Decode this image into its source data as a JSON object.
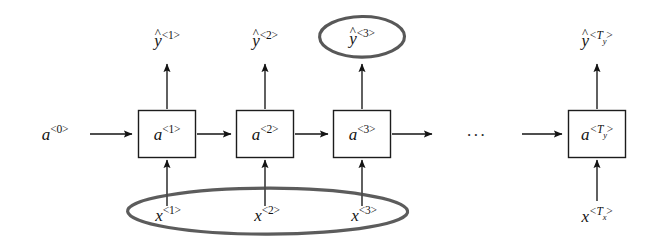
{
  "figure": {
    "background_color": "#ffffff",
    "ink_color": "#141414",
    "annotation_color": "#4a4a4a"
  },
  "inputs": {
    "initial_activation": {
      "base": "a",
      "superscript": "<0>",
      "text": "a<0>"
    },
    "sequence": [
      {
        "base": "x",
        "superscript": "<1>",
        "text": "x<1>"
      },
      {
        "base": "x",
        "superscript": "<2>",
        "text": "x<2>"
      },
      {
        "base": "x",
        "superscript": "<3>",
        "text": "x<3>"
      },
      {
        "base": "x",
        "superscript": "<T",
        "subscript": "x",
        "text": "x<Tx>"
      }
    ]
  },
  "cells": [
    {
      "base": "a",
      "superscript": "<1>",
      "text": "a<1>"
    },
    {
      "base": "a",
      "superscript": "<2>",
      "text": "a<2>"
    },
    {
      "base": "a",
      "superscript": "<3>",
      "text": "a<3>"
    },
    {
      "base": "a",
      "superscript": "<T",
      "subscript": "y",
      "text": "a<Ty>"
    }
  ],
  "outputs": [
    {
      "base": "y",
      "hat": "^",
      "superscript": "<1>",
      "text": "y^<1>"
    },
    {
      "base": "y",
      "hat": "^",
      "superscript": "<2>",
      "text": "y^<2>"
    },
    {
      "base": "y",
      "hat": "^",
      "superscript": "<3>",
      "text": "y^<3>"
    },
    {
      "base": "y",
      "hat": "^",
      "superscript": "<T",
      "subscript": "y",
      "text": "y^<Ty>"
    }
  ],
  "ellipsis": {
    "label": "..."
  },
  "annotations": [
    {
      "name": "output-highlight",
      "shape": "ellipse",
      "target": "y^<3>",
      "color": "#4a4a4a"
    },
    {
      "name": "input-sequence-highlight",
      "shape": "ellipse",
      "target": "x<1> x<2> x<3>",
      "color": "#4a4a4a"
    }
  ]
}
